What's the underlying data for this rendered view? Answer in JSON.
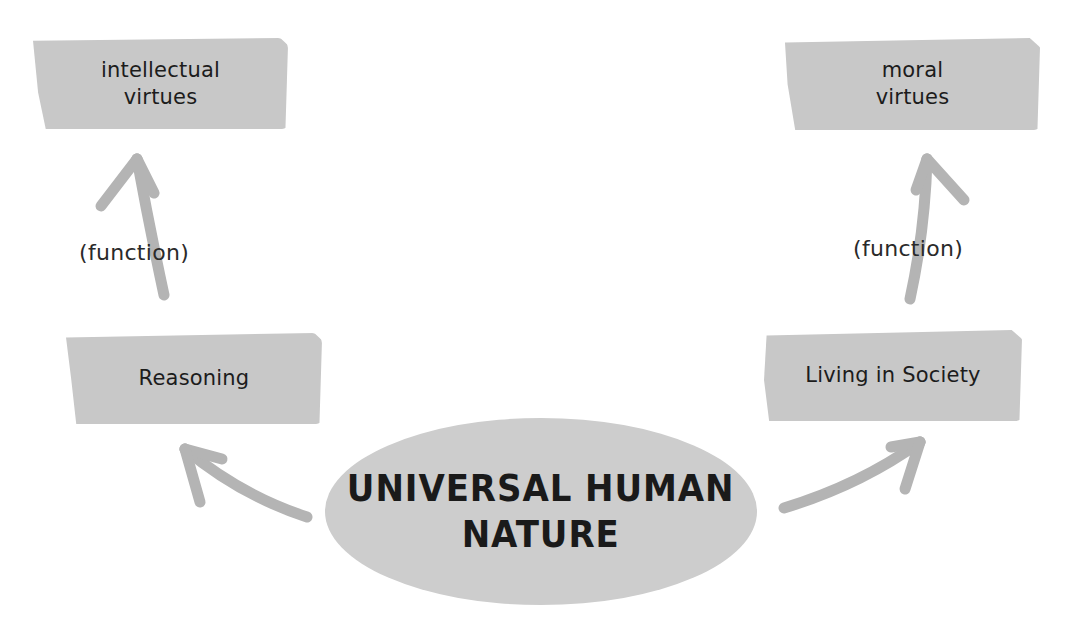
{
  "diagram": {
    "center": {
      "line1": "UNIVERSAL HUMAN",
      "line2": "NATURE"
    },
    "left_branch": {
      "capacity": "Reasoning",
      "connector_label": "(function)",
      "virtue": {
        "line1": "intellectual",
        "line2": "virtues"
      }
    },
    "right_branch": {
      "capacity": "Living in Society",
      "connector_label": "(function)",
      "virtue": {
        "line1": "moral",
        "line2": "virtues"
      }
    },
    "colors": {
      "box_fill": "#c8c8c8",
      "ellipse_fill": "#cdcdcd",
      "arrow": "#b4b4b4",
      "text": "#1c1c1c"
    }
  }
}
